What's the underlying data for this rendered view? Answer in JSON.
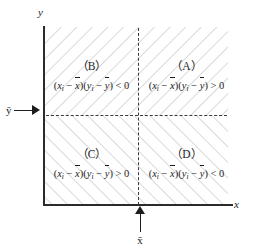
{
  "figure": {
    "axes": {
      "x_label": "x",
      "y_label": "y",
      "x_mean_label": "x̄",
      "y_mean_label": "ȳ"
    },
    "colors": {
      "axis": "#2b2b2b",
      "dashed_line": "#3a3a3a",
      "hatch": "#c9c9c9",
      "text": "#1d1d1d",
      "background": "#ffffff"
    },
    "quadrants": [
      {
        "id": "A",
        "tag": "（A）",
        "position": "top-right",
        "expression": "(xᵢ − x̄)(yᵢ − ȳ) > 0",
        "sign": ">",
        "lhs_first": "x",
        "lhs_first_sub": "i",
        "lhs_first_mean": "x",
        "lhs_second": "y",
        "lhs_second_sub": "i",
        "lhs_second_mean": "y",
        "rhs": "0"
      },
      {
        "id": "B",
        "tag": "（B）",
        "position": "top-left",
        "expression": "(xᵢ − x̄)(yᵢ − ȳ) < 0",
        "sign": "<",
        "lhs_first": "x",
        "lhs_first_sub": "i",
        "lhs_first_mean": "x",
        "lhs_second": "y",
        "lhs_second_sub": "i",
        "lhs_second_mean": "y",
        "rhs": "0"
      },
      {
        "id": "C",
        "tag": "（C）",
        "position": "bottom-left",
        "expression": "(xᵢ − x̄)(yᵢ − ȳ) > 0",
        "sign": ">",
        "lhs_first": "x",
        "lhs_first_sub": "i",
        "lhs_first_mean": "x",
        "lhs_second": "y",
        "lhs_second_sub": "i",
        "lhs_second_mean": "y",
        "rhs": "0"
      },
      {
        "id": "D",
        "tag": "（D）",
        "position": "bottom-right",
        "expression": "(xᵢ − x̄)(yᵢ − ȳ) < 0",
        "sign": "<",
        "lhs_first": "x",
        "lhs_first_sub": "i",
        "lhs_first_mean": "x",
        "lhs_second": "y",
        "lhs_second_sub": "i",
        "lhs_second_mean": "y",
        "rhs": "0"
      }
    ]
  }
}
